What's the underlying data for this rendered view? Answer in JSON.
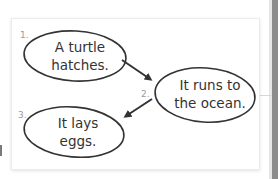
{
  "diagram": {
    "type": "sequence-flow",
    "steps": [
      {
        "number": "1.",
        "line1": "A turtle",
        "line2": "hatches."
      },
      {
        "number": "2.",
        "line1": "It runs to",
        "line2": "the ocean."
      },
      {
        "number": "3.",
        "line1": "It lays",
        "line2": "eggs."
      }
    ],
    "edges": [
      {
        "from": 1,
        "to": 2
      },
      {
        "from": 2,
        "to": 3
      }
    ],
    "colors": {
      "stroke": "#333333",
      "step_number": "#9a9a9a",
      "card_border": "#ececec",
      "side_bar": "#8c8c8c"
    }
  }
}
